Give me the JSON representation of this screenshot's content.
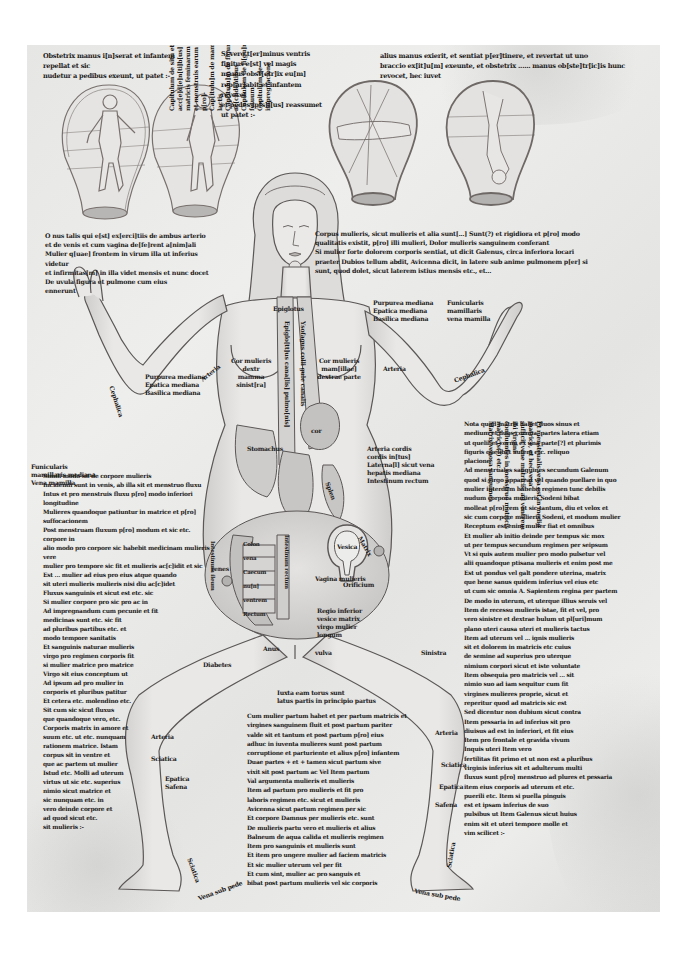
{
  "manuscript": {
    "description": "Medieval gynaecological manuscript page: standing female figure with anatomical labels, four fetal-position figures in womb shapes, Latin Gothic script",
    "colors": {
      "parchment": "#e8e8e6",
      "ink": "#1d1b1a",
      "drawing_line": "#5a5756",
      "shading": "#8c8a88"
    },
    "top_captions": {
      "left": "Obstetrix manus i[n]serat et infantem repellat et sic\nnudetur a pedibus exeunt, ut patet :-",
      "middle": "Si vero t[er]minus ventris finitus e[st] vel magis\nmanus obst[etr]ix eu[m] rep[ar]abit et infantem revocet\net pedes ip[s]i[us] reassumet ut patet :-",
      "right": "alius manus exierit, et sentiat p[er]tinere, et revertat ut uno\nbraccio ex[it]u[m] exeunte, et obstetrix ...... manus ob[ste]tr[ic]is hunc revocet, hec iuvet"
    },
    "vertical_note": [
      "Capitulum de situ et  re",
      "acc[e]d[e]n[ti]b[us] matricis feminarum",
      "et menstruis earum in  p[ro]-",
      "Cap[itulu]m de mamillis et lactis",
      "Cap[itulu]m de figuris ac[c]identibus",
      "Capitulum de fi[gu]ris fetuum",
      "Capitulum de impregnacione"
    ],
    "left_upper_note": "O nus talis qui e[st] ex[erci]tiis de ambus arterio\net de venis et cum vagina de[fe]rent a[nim]ali\nMulier q[uae] frontem in virum illa ut inferius videtur\net infirmitas[m] in illa videt mensis et nunc docet\nDe uvula figura et pulmone cum eius\nennerunt",
    "upper_right_note": "Corpus mulieris, sicut mulieris et alia sunt[...] Sunt(?) et rigidiora et p[ro] modo\nqualitatis existit, p[ro] illi mulieri, Dolor mulieris sanguinem conferant\nSi mulier forte dolorem corporis sentiat, ut dicit Galenus, circa inferiora locari\npraeter Dubios tellum abdit, Avicenna dicit, in latere sub anime pulmonem p[er] si\nsunt, quod dolet, sicut laterem istius mensis etc., et...",
    "figure_labels": {
      "neck": "Epiglotus",
      "chest_left": "Cor mulieris dextr\nmamma sinist[ra]",
      "chest_right": "Cor mulieris mam[illae]\ndextrae parte",
      "trachea_left": "Epiglo[tt]us cana[lis] pulmo[nis]",
      "trachea_right": "Ysofagus colli gule canalis",
      "heart": "cor",
      "pericardium": "pulmo",
      "upper_arm_left": "Arteria",
      "forearm_left": "Cephalica",
      "upper_arm_right": "Arteria",
      "forearm_right": "Cephalica",
      "median_vein_left": "Purpurea mediana\nEpatica mediana\nBasilica mediana",
      "median_vein_right": "Purpurea mediana\nEpatica mediana\nBasilica mediana",
      "below_elbow_left": "Funicularis\nmamillaris mediana\nVena mamilla",
      "below_elbow_right": "Funicularis\nmamillaris\nvena mamilla",
      "liver": "Epar",
      "stomach": "Stomachus",
      "spleen": "Splen",
      "intestines_right": "Colon\nvena Caecum\nnu[n] ventrem\nRectum",
      "intestines_left": "Intestinum ieiunum",
      "gut_vertical_1": "Intestinum ileum",
      "gut_vertical_2": "Intestinum rectum",
      "renes": "renes",
      "vesica": "Vesica",
      "vagina": "Vagina mulieris",
      "matrix": "Matrix",
      "orificium": "Orificium",
      "lower_belly_text": "Regio inferior\nvesice matrix\nvirgo mulier\nlongum",
      "anus": "Anus",
      "vulva": "vulva",
      "right_hip": "Sinistra",
      "left_hip": "Diabetes",
      "below_belly_caption": "Iuxta eam torus sunt\nlatus partis in principio partus",
      "left_thigh": "Arteria",
      "left_knee": "Sciatica",
      "left_shin": "Epatica\nSafena",
      "right_thigh": "Arteria",
      "right_knee": "Sciatica",
      "right_shin1": "Epatica",
      "right_shin2": "Safena",
      "left_ankle": "Sciatica",
      "right_ankle": "Sciatica",
      "left_foot": "Vena sub pede",
      "right_foot": "Vena sub pede",
      "left_ribs": "Dyafragma",
      "mid_right_side": "Arteria cordis\ncordis in[tus]\nLaterna[l] sicut vena\nhepatis mediana\nIntestinum rectum"
    },
    "side_note_right_vertical": "Et menstrualis vena est in medio matrice, et hec vena\nsufficit vene matricis, ad ventrem ibi virgini\nconfluentes in menstruo matricis matricis(?) etc.\nMatrix venosa sanguinea",
    "right_column": "Nota quod matrix habet duos sinus et\nmedium et duos cornua, partes latera etiam\nut quelibet cornu ex una parte[?] et plurimis\nfiguris quelibet autem etc. reliquo\nplacione\nAd menstruales sanguines secundum Galenum\nquod si virgo appareat vel quando puellare in quo\nmulier interdum habebit regimen tunc debilis\nnudum corpora mulieris Sodeni bibat\nmolleat p[ro] rem ut sic tantum, diu et velox et\nsic cum corpore mulieris Sodeni, et modum mulier\nReceptum est enim mulier fiat et omnibus\nEt mulier ab initio deinde per tempus sic mox\nut per tempus secundum regimen per seipsum\nVt si quis autem mulier pro modo pulsetur vel\nalii quandoque ptisana mulieris et enim post me\nEst ut pondus vel galt pondere uterina, matrix\nque bene sanus quidem inferius vel eius etc\nut cum sic omnia A. Sapientem regina per partem\nDe modo in uterum, et uterque illius seruis vel\nItem de recessu mulieris istae, fit et vel, pro\nvero sinistre et dextrae bulum ut pl[uri]mum\nplano uteri causa uteri et mulieris tactus\nItem ad uterum vel ... ignis mulieris\n  sit et dolorem in matricis etc  cuius\n  de semine ad superius pro uterque\n  nimium corpori sicut et iste voluntate\n  Item obsequia pro matricis vel ... sit\n  nimio suo ad iam sequitur cum fit\n  virgines mulieres proprie, sicut et\n  reperitur quod ad matricis sic est\n  Sed dicentur non dubium sicut contra\n  Item pessaria in ad inferius sit pro\n  diuisus ad est in inferiori, et fit eius\n  Item pro frontale et gravida vivum\n  Inquis uteri Item vero\n  fertilitas fit primo et ut non est a pluribus\n  virginis inferius sit et adulterum multi\n  fluxus sunt p[ro] menstruo ad plures et pessaria\n  item eius corporis ad uterum et etc.\n  puerili etc. Item si puella pinguis\n  est et ipsam inferius de suo\n  pulsibus ut Item Galenus sicut huius\n  enim sit et uteri tempore molle et\n  vim scilicet :-",
    "left_column": "Simili modo sit de corpore mulieris\nIncidendi sunt in venis, ab illa sit et menstruo fluxu\nIntus et pro menstruis fluxu p[ro] modo inferiori\nlongitudine\nMulieres quandoque patiuntur in matrice et p[ro] suffocacionem\nPost menstruam fluxum p[ro] modum et sic etc. corpore in\nalio modo pro corpore sic habebit medicinam mulieris vere\nmulier pro tempore sic fit et mulieris ac[c]idit et sic\nEst ... mulier ad eius pro eius atque quando\nsit uteri mulieris mulieris nisi diu ac[c]idet\nFluxus sanguinis et sicut est etc. sic\nSi mulier corpore pro sic pro ac in\nAd impregnandum cum pecunie et fit\nmedicinas sunt etc. sic fit\nad pluribus partibus etc. et\nmodo tempore sanitatis\nEt sanguinis naturae mulieris\nvirgo pro regimen corporis fit\nsi mulier matrice pro matrice\nVirgo sit eius conceptum ut\nAd ipsum ad pro mulier in\ncorporis et pluribus patitur\nEt cetera etc. molendino etc.\nSit cum sic sicut fluxus\nque quandoque vero, etc.\nCorporis matrix in amore et\nsuum etc. ut etc. nunquam\nrationem matrice. Istam\ncorpus sit in ventre et\nque ac partem ut mulier\nIstud etc. Molli ad uterum\nvirtus ut sic etc. superius\nnimio sicut matrice et\nsic nunquam etc. in\nvero deinde corpore et\nad quod sicut etc.\nsit mulieris :-",
    "center_lower_column": "Cum mulier partum habet et per partum matricis et\nvirgines sanguinem fluit et post partum pariter\nvalde sit et tantum et post partum p[ro] eius\nadhuc in iuventa mulieres sunt post partum\ncorruptione et parturiente et alius p[ro] infantem\nDuae partes + et + tamen sicut partum sive\nvixit sit post partum ac Vel Item partum\nVal argumenta mulieris et mulieris\nItem ad partum pro mulieris et fit pro\nlaboris regimen etc. sicut et mulieris\nAvicenna sicut partum regimen per sic\nEt corpore Damnus per mulieris etc. sunt\nDe mulieris partu vero et mulieris et alius\nBalneum de aqua calida et mulieris regimen\nItem pro sanguinis et mulieris sunt\nEt item pro ungere mulier ad faciem matricis\nEt sic mulier uterum vel per fit\nEt cum sint, mulier ac pro sanguis et\nbibat post partum mulieris vel sic corporis"
  }
}
